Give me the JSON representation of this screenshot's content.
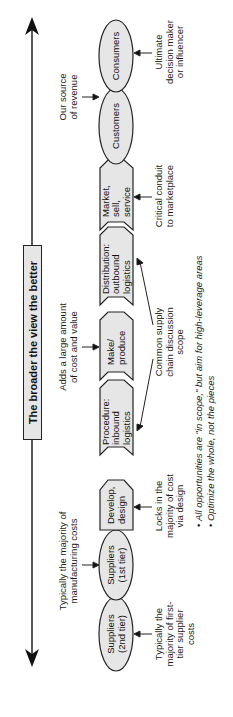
{
  "diagram": {
    "orientation": "rotated-90-ccw",
    "scope_arrow": {
      "label": "The broader the view the better",
      "direction": "bidirectional"
    },
    "chain": [
      {
        "id": "suppliers-2nd",
        "shape": "ellipse",
        "label": "Suppliers\n(2nd tier)",
        "annotation": "Typically the\nmajority of first-\ntier supplier\ncosts",
        "annotation_side": "below"
      },
      {
        "id": "suppliers-1st",
        "shape": "ellipse",
        "label": "Suppliers\n(1st tier)",
        "annotation": "Typically the majority of\nmanufacturing costs",
        "annotation_side": "above"
      },
      {
        "id": "develop",
        "shape": "chevron",
        "label": "Develop,\ndesign",
        "annotation": "Locks in the\nmajority of cost\nvia design",
        "annotation_side": "below"
      },
      {
        "id": "procedure",
        "shape": "chevron",
        "label": "Procedure:\ninbound\nlogistics",
        "annotation": "",
        "annotation_side": ""
      },
      {
        "id": "make",
        "shape": "chevron",
        "label": "Make/\nproduce",
        "annotation": "Adds a large amount\nof cost and value",
        "annotation_side": "above"
      },
      {
        "id": "distribution",
        "shape": "chevron",
        "label": "Distribution:\noutbound\nlogistics",
        "annotation": "",
        "annotation_side": ""
      },
      {
        "id": "market",
        "shape": "chevron",
        "label": "Market,\nsell,\nservice",
        "annotation": "Critical conduit\nto marketplace",
        "annotation_side": "below"
      },
      {
        "id": "customers",
        "shape": "ellipse",
        "label": "Customers",
        "annotation": "Our source\nof revenue",
        "annotation_side": "above"
      },
      {
        "id": "consumers",
        "shape": "ellipse",
        "label": "Consumers",
        "annotation": "Ultimate\ndecision maker\nor influencer",
        "annotation_side": "below"
      }
    ],
    "scope_note": "Common supply\nchain discussion\nscope",
    "bullets": [
      "All opportunities are \"in scope,\" but aim for high-leverage areas",
      "Optimize the whole, not the pieces"
    ],
    "colors": {
      "shape_fill": "#e6e6e6",
      "stroke": "#222222",
      "background": "#ffffff"
    }
  }
}
